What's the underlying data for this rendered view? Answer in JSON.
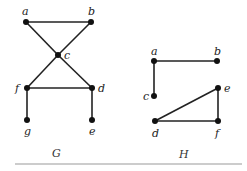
{
  "graphs": [
    {
      "name": "G",
      "caption": "G",
      "vertices": [
        {
          "id": "a",
          "label": "a",
          "x": 26,
          "y": 22,
          "lx": 22,
          "ly": 15
        },
        {
          "id": "b",
          "label": "b",
          "x": 91,
          "y": 22,
          "lx": 88,
          "ly": 15
        },
        {
          "id": "c",
          "label": "c",
          "x": 58,
          "y": 55,
          "lx": 64,
          "ly": 59
        },
        {
          "id": "f",
          "label": "f",
          "x": 27,
          "y": 88,
          "lx": 15,
          "ly": 92
        },
        {
          "id": "d",
          "label": "d",
          "x": 92,
          "y": 88,
          "lx": 98,
          "ly": 92
        },
        {
          "id": "g",
          "label": "g",
          "x": 27,
          "y": 120,
          "lx": 24,
          "ly": 135
        },
        {
          "id": "e",
          "label": "e",
          "x": 92,
          "y": 120,
          "lx": 89,
          "ly": 135
        }
      ],
      "edges": [
        [
          "a",
          "b"
        ],
        [
          "a",
          "c"
        ],
        [
          "b",
          "c"
        ],
        [
          "c",
          "f"
        ],
        [
          "c",
          "d"
        ],
        [
          "f",
          "d"
        ],
        [
          "f",
          "g"
        ],
        [
          "d",
          "e"
        ]
      ],
      "caption_pos": {
        "x": 52,
        "y": 157
      }
    },
    {
      "name": "H",
      "caption": "H",
      "vertices": [
        {
          "id": "a",
          "label": "a",
          "x": 154,
          "y": 61,
          "lx": 151,
          "ly": 55
        },
        {
          "id": "b",
          "label": "b",
          "x": 217,
          "y": 61,
          "lx": 214,
          "ly": 55
        },
        {
          "id": "c",
          "label": "c",
          "x": 154,
          "y": 96,
          "lx": 143,
          "ly": 100
        },
        {
          "id": "e",
          "label": "e",
          "x": 218,
          "y": 88,
          "lx": 224,
          "ly": 92
        },
        {
          "id": "d",
          "label": "d",
          "x": 155,
          "y": 121,
          "lx": 152,
          "ly": 137
        },
        {
          "id": "f",
          "label": "f",
          "x": 218,
          "y": 121,
          "lx": 215,
          "ly": 137
        }
      ],
      "edges": [
        [
          "a",
          "b"
        ],
        [
          "a",
          "c"
        ],
        [
          "d",
          "e"
        ],
        [
          "d",
          "f"
        ],
        [
          "e",
          "f"
        ]
      ],
      "caption_pos": {
        "x": 179,
        "y": 158
      }
    }
  ],
  "rule": {
    "x1": 15,
    "x2": 242,
    "y": 164,
    "color": "#999999"
  }
}
